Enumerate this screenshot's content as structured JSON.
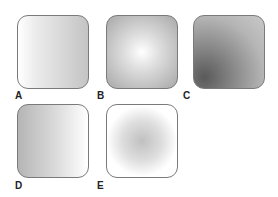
{
  "swatches": [
    {
      "label": "A",
      "type": "linear gradient",
      "direction": "left-to-right",
      "colors": [
        "#ffffff",
        "#c4c4c4"
      ]
    },
    {
      "label": "B",
      "type": "radial gradient",
      "center": "middle",
      "colors": [
        "#ffffff",
        "#a8a8a8"
      ]
    },
    {
      "label": "C",
      "type": "radial gradient",
      "center": "bottom-left",
      "colors": [
        "#5a5a5a",
        "#c9c9c9"
      ]
    },
    {
      "label": "D",
      "type": "linear gradient",
      "direction": "left-to-right",
      "colors": [
        "#b5b5b5",
        "#ffffff"
      ]
    },
    {
      "label": "E",
      "type": "radial gradient",
      "center": "middle",
      "colors": [
        "#c0c0c0",
        "#ffffff"
      ]
    }
  ]
}
